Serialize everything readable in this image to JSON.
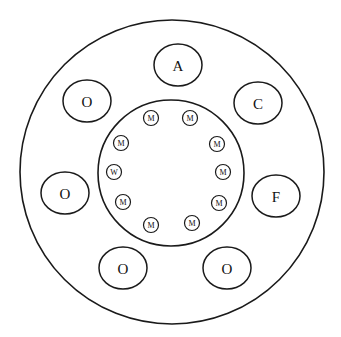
{
  "diagram": {
    "outer_circle": {
      "cx": 172,
      "cy": 172,
      "r": 152
    },
    "inner_circle": {
      "cx": 171,
      "cy": 173,
      "r": 73
    },
    "outer_nodes": [
      {
        "label": "A",
        "cx": 178,
        "cy": 65,
        "rx": 24,
        "ry": 21
      },
      {
        "label": "C",
        "cx": 258,
        "cy": 103,
        "rx": 24,
        "ry": 21
      },
      {
        "label": "F",
        "cx": 276,
        "cy": 196,
        "rx": 24,
        "ry": 21
      },
      {
        "label": "O",
        "cx": 227,
        "cy": 268,
        "rx": 24,
        "ry": 21
      },
      {
        "label": "O",
        "cx": 123,
        "cy": 268,
        "rx": 24,
        "ry": 21
      },
      {
        "label": "O",
        "cx": 65,
        "cy": 193,
        "rx": 24,
        "ry": 21
      },
      {
        "label": "O",
        "cx": 87,
        "cy": 101,
        "rx": 24,
        "ry": 21
      }
    ],
    "inner_nodes": [
      {
        "label": "M",
        "cx": 151,
        "cy": 118
      },
      {
        "label": "M",
        "cx": 190,
        "cy": 118
      },
      {
        "label": "M",
        "cx": 217,
        "cy": 144
      },
      {
        "label": "M",
        "cx": 223,
        "cy": 172
      },
      {
        "label": "M",
        "cx": 219,
        "cy": 203
      },
      {
        "label": "M",
        "cx": 192,
        "cy": 223
      },
      {
        "label": "M",
        "cx": 151,
        "cy": 225
      },
      {
        "label": "M",
        "cx": 123,
        "cy": 202
      },
      {
        "label": "W",
        "cx": 114,
        "cy": 172
      },
      {
        "label": "M",
        "cx": 121,
        "cy": 143
      }
    ],
    "inner_node_radius": 7.5
  }
}
